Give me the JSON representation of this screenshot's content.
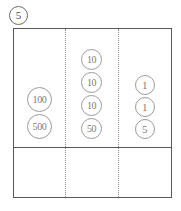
{
  "worksheet": {
    "problem_number": "5",
    "problem_number_style": "circled"
  },
  "money_box": {
    "columns": [
      {
        "name": "hundreds",
        "coins": [
          {
            "value": "100",
            "size": "size-lg"
          },
          {
            "value": "500",
            "size": "size-lg"
          }
        ]
      },
      {
        "name": "tens",
        "coins": [
          {
            "value": "10",
            "size": "size-md"
          },
          {
            "value": "10",
            "size": "size-md"
          },
          {
            "value": "10",
            "size": "size-md"
          },
          {
            "value": "50",
            "size": "size-md"
          }
        ]
      },
      {
        "name": "ones",
        "coins": [
          {
            "value": "1",
            "size": "size-sm"
          },
          {
            "value": "1",
            "size": "size-sm"
          },
          {
            "value": "5",
            "size": "size-sm"
          }
        ]
      }
    ],
    "answer_row": {
      "cells": [
        "",
        "",
        ""
      ]
    }
  },
  "colors": {
    "frame": "#595959",
    "divider_dotted": "#8a8a8a",
    "coin_outline": "#9b9b9b",
    "coin_text": "#7d7d7d",
    "problem_number": "#4a4a4a",
    "background": "#ffffff"
  }
}
